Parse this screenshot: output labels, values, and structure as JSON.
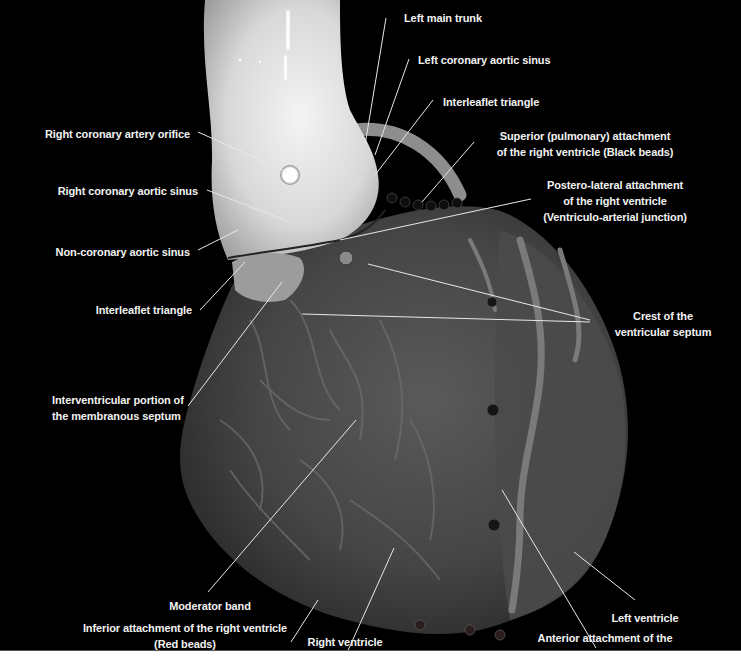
{
  "figure": {
    "background_color": "#000000",
    "label_color": "#f2f2f2",
    "bead_colors": {
      "black_beads": "#111111",
      "red_beads": "#2a1a1a",
      "blue_beads": "#1a1a22"
    }
  },
  "labels": {
    "left_main_trunk": "Left main trunk",
    "left_coronary_aortic_sinus": "Left coronary aortic sinus",
    "interleaflet_triangle_top": "Interleaflet triangle",
    "right_coronary_artery_orifice": "Right coronary artery orifice",
    "superior_attachment_l1": "Superior (pulmonary) attachment",
    "superior_attachment_l2": "of the right ventricle (Black beads)",
    "right_coronary_aortic_sinus": "Right coronary aortic sinus",
    "postero_lateral_l1": "Postero-lateral attachment",
    "postero_lateral_l2": "of the right ventricle",
    "postero_lateral_l3": "(Ventriculo-arterial junction)",
    "non_coronary_aortic_sinus": "Non-coronary aortic sinus",
    "interleaflet_triangle_left": "Interleaflet triangle",
    "crest_l1": "Crest of the",
    "crest_l2": "ventricular septum",
    "interventricular_l1": "Interventricular portion of",
    "interventricular_l2": "the membranous septum",
    "moderator_band": "Moderator band",
    "inferior_attachment_l1": "Inferior attachment of the right ventricle",
    "inferior_attachment_l2": "(Red beads)",
    "right_ventricle": "Right ventricle",
    "left_ventricle": "Left ventricle",
    "anterior_attachment_l1": "Anterior attachment of the",
    "anterior_attachment_l2": "right ventricle (Blue beads)"
  }
}
